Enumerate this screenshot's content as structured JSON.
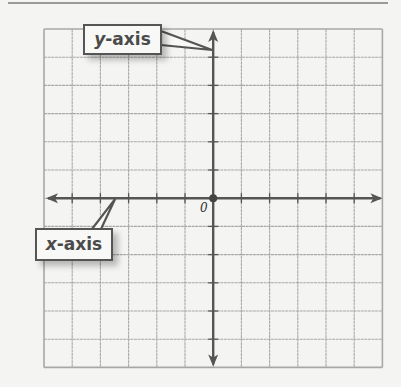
{
  "diagram": {
    "type": "coordinate-plane",
    "grid": {
      "columns": 12,
      "rows": 12,
      "left": 44,
      "top": 29,
      "cell_size": 28.2,
      "line_color": "#a8a8a8",
      "border_color": "#9a9a9a"
    },
    "axes": {
      "color": "#555555",
      "origin_col": 6,
      "origin_row": 6
    },
    "labels": {
      "y_axis": {
        "variable": "y",
        "suffix": "-axis"
      },
      "x_axis": {
        "variable": "x",
        "suffix": "-axis"
      },
      "origin": "0"
    }
  }
}
